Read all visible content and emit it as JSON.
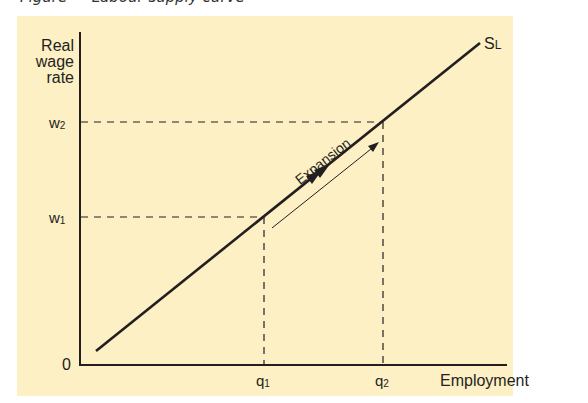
{
  "caption": "Figure — Labour supply curve",
  "diagram": {
    "y_axis_label": [
      "Real",
      "wage",
      "rate"
    ],
    "x_axis_label": "Employment",
    "origin_label": "0",
    "curve_label": {
      "main": "S",
      "sub": "L"
    },
    "w1": {
      "main": "w",
      "sub": "1"
    },
    "w2": {
      "main": "w",
      "sub": "2"
    },
    "q1": {
      "main": "q",
      "sub": "1"
    },
    "q2": {
      "main": "q",
      "sub": "2"
    },
    "arrow_label": "Expansion",
    "colors": {
      "background": "#fdf0c4",
      "ink": "#231f20"
    }
  }
}
